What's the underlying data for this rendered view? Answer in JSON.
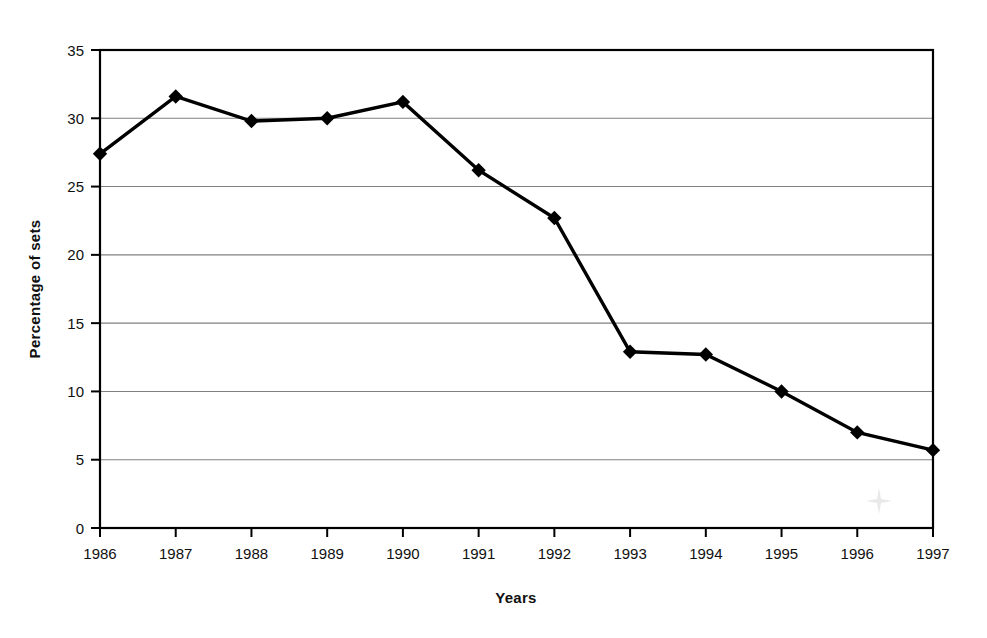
{
  "chart_data": {
    "type": "line",
    "title": "",
    "subtitle": "",
    "xlabel": "Years",
    "ylabel": "Percentage of sets",
    "categories": [
      "1986",
      "1987",
      "1988",
      "1989",
      "1990",
      "1991",
      "1992",
      "1993",
      "1994",
      "1995",
      "1996",
      "1997"
    ],
    "x": [
      1986,
      1987,
      1988,
      1989,
      1990,
      1991,
      1992,
      1993,
      1994,
      1995,
      1996,
      1997
    ],
    "values": [
      27.4,
      31.6,
      29.8,
      30.0,
      31.2,
      26.2,
      22.7,
      12.9,
      12.7,
      10.0,
      7.0,
      5.7
    ],
    "series": [
      {
        "name": "Percentage of sets",
        "values": [
          27.4,
          31.6,
          29.8,
          30.0,
          31.2,
          26.2,
          22.7,
          12.9,
          12.7,
          10.0,
          7.0,
          5.7
        ],
        "color": "#000000",
        "marker": "diamond"
      }
    ],
    "ylim": [
      0,
      35
    ],
    "yticks": [
      0,
      5,
      10,
      15,
      20,
      25,
      30,
      35
    ],
    "ytick_labels": [
      "0",
      "5",
      "10",
      "15",
      "20",
      "25",
      "30",
      "35"
    ],
    "grid": "horizontal",
    "grid_color": "#808080",
    "legend": "none",
    "legend_position": "none",
    "axis_color": "#000000",
    "plot_background": "#ffffff",
    "annotations": []
  },
  "axes": {
    "y_title": "Percentage of sets",
    "x_title": "Years"
  },
  "artifacts": {
    "scan_smudge": ""
  }
}
